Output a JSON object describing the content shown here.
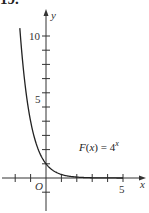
{
  "problem_number": "19.",
  "chart_data": {
    "type": "line",
    "title": "",
    "function_label": "F(x) = 4",
    "function_label_exponent": "x",
    "xlabel": "x",
    "ylabel": "y",
    "origin_label": "O",
    "x_tick_labels": [
      {
        "value": 5,
        "label": "5"
      }
    ],
    "y_tick_labels": [
      {
        "value": 5,
        "label": "5"
      },
      {
        "value": 10,
        "label": "10"
      }
    ],
    "x_ticks": [
      -2,
      -1,
      1,
      2,
      3,
      4,
      5
    ],
    "y_ticks": [
      -1,
      1,
      2,
      3,
      4,
      5,
      6,
      7,
      8,
      9,
      10
    ],
    "xlim": [
      -2.9,
      6.4
    ],
    "ylim": [
      -2.2,
      11.9
    ],
    "grid": false,
    "legend": "none",
    "series": [
      {
        "name": "F(x) = 4^x",
        "x": [
          -1.7,
          -1.5,
          -1.25,
          -1.0,
          -0.75,
          -0.5,
          -0.25,
          0,
          0.5,
          1.0,
          1.5,
          2.0,
          2.5,
          3.0,
          4.0,
          5.0
        ],
        "values": [
          10.56,
          8.0,
          5.66,
          4.0,
          2.83,
          2.0,
          1.41,
          1.0,
          0.5,
          0.25,
          0.125,
          0.06,
          0.03,
          0.016,
          0.004,
          0.001
        ]
      }
    ],
    "colors": {
      "axis": "#333333",
      "curve": "#222222"
    }
  }
}
